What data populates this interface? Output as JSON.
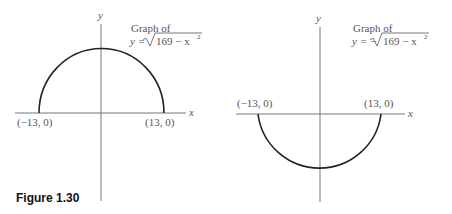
{
  "caption": "Figure 1.30",
  "panels": [
    {
      "title_line1": "Graph of",
      "formula_prefix": "y =",
      "formula_radicand": "169 − x",
      "formula_exp": "2",
      "axis_x_label": "x",
      "axis_y_label": "y",
      "left_point": "(−13, 0)",
      "right_point": "(13, 0)",
      "curve": "upper semicircle"
    },
    {
      "title_line1": "Graph of",
      "formula_prefix": "y = −",
      "formula_radicand": "169 − x",
      "formula_exp": "2",
      "axis_x_label": "x",
      "axis_y_label": "y",
      "left_point": "(−13, 0)",
      "right_point": "(13, 0)",
      "curve": "lower semicircle"
    }
  ],
  "colors": {
    "axis": "#777777",
    "curve": "#222222",
    "text": "#555555"
  }
}
